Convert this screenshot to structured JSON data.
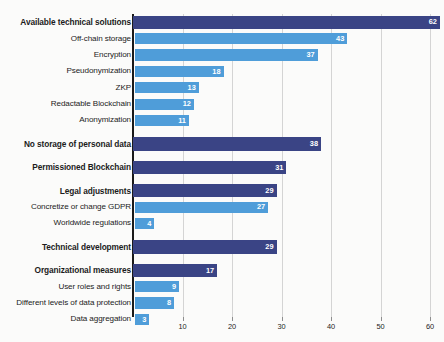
{
  "chart_data": {
    "type": "bar",
    "orientation": "horizontal",
    "title": "",
    "xlabel": "",
    "ylabel": "",
    "xlim": [
      0,
      62
    ],
    "xticks": [
      10,
      20,
      30,
      40,
      50,
      60
    ],
    "grid": true,
    "legend": false,
    "colors": {
      "category": "#3a4485",
      "subitem": "#4f9dd9",
      "background": "#fbfbfa",
      "gridline": "#d4d4d4",
      "axis": "#1a1a1a",
      "value_label": "#ffffff"
    },
    "categories": [
      "Available technical solutions",
      "Off-chain storage",
      "Encryption",
      "Pseudonymization",
      "ZKP",
      "Redactable Blockchain",
      "Anonymization",
      "No storage of personal data",
      "Permissioned Blockchain",
      "Legal adjustments",
      "Concretize or change GDPR",
      "Worldwide regulations",
      "Technical development",
      "Organizational measures",
      "User roles and rights",
      "Different levels of data protection",
      "Data aggregation"
    ],
    "values": [
      62,
      43,
      37,
      18,
      13,
      12,
      11,
      38,
      31,
      29,
      27,
      4,
      29,
      17,
      9,
      8,
      3
    ],
    "rows": [
      {
        "label": "Available technical solutions",
        "value": 62,
        "level": "category",
        "spacer_before": false
      },
      {
        "label": "Off-chain storage",
        "value": 43,
        "level": "sub",
        "spacer_before": false
      },
      {
        "label": "Encryption",
        "value": 37,
        "level": "sub",
        "spacer_before": false
      },
      {
        "label": "Pseudonymization",
        "value": 18,
        "level": "sub",
        "spacer_before": false
      },
      {
        "label": "ZKP",
        "value": 13,
        "level": "sub",
        "spacer_before": false
      },
      {
        "label": "Redactable Blockchain",
        "value": 12,
        "level": "sub",
        "spacer_before": false
      },
      {
        "label": "Anonymization",
        "value": 11,
        "level": "sub",
        "spacer_before": false
      },
      {
        "label": "No storage of personal data",
        "value": 38,
        "level": "category",
        "spacer_before": true
      },
      {
        "label": "Permissioned Blockchain",
        "value": 31,
        "level": "category",
        "spacer_before": true
      },
      {
        "label": "Legal adjustments",
        "value": 29,
        "level": "category",
        "spacer_before": true
      },
      {
        "label": "Concretize or change GDPR",
        "value": 27,
        "level": "sub",
        "spacer_before": false
      },
      {
        "label": "Worldwide regulations",
        "value": 4,
        "level": "sub",
        "spacer_before": false
      },
      {
        "label": "Technical development",
        "value": 29,
        "level": "category",
        "spacer_before": true
      },
      {
        "label": "Organizational measures",
        "value": 17,
        "level": "category",
        "spacer_before": true
      },
      {
        "label": "User roles and rights",
        "value": 9,
        "level": "sub",
        "spacer_before": false
      },
      {
        "label": "Different levels of data protection",
        "value": 8,
        "level": "sub",
        "spacer_before": false
      },
      {
        "label": "Data aggregation",
        "value": 3,
        "level": "sub",
        "spacer_before": false
      }
    ]
  }
}
